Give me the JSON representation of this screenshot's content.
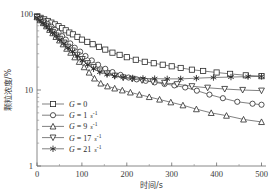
{
  "chart_data": {
    "type": "line",
    "title": "",
    "xlabel": "时间/s",
    "ylabel": "颗粒浓度/%",
    "xlim": [
      0,
      510
    ],
    "ylim": [
      1,
      100
    ],
    "yscale": "log",
    "grid": false,
    "legend_position": "lower-left-inside",
    "xticks": [
      "0",
      "100",
      "200",
      "300",
      "400",
      "500"
    ],
    "xtick_values": [
      0,
      100,
      200,
      300,
      400,
      500
    ],
    "yticks": [
      "1",
      "10",
      "100"
    ],
    "ytick_values": [
      1,
      10,
      100
    ],
    "series": [
      {
        "name": "G = 0",
        "legend_symbol": "G",
        "legend_value": "0",
        "legend_unit": "",
        "legend_exponent": "",
        "marker": "square",
        "x": [
          0,
          8,
          16,
          24,
          32,
          40,
          48,
          56,
          64,
          72,
          80,
          90,
          100,
          112,
          124,
          138,
          152,
          168,
          184,
          200,
          220,
          240,
          260,
          280,
          300,
          320,
          345,
          370,
          400,
          430,
          465,
          500
        ],
        "y": [
          93,
          89,
          85,
          81,
          77,
          73,
          69,
          65,
          61,
          57,
          54,
          50,
          46,
          43,
          40,
          37,
          34,
          31,
          29,
          27,
          25,
          23.5,
          22.5,
          21.5,
          20.5,
          19.5,
          18.5,
          17.8,
          17.0,
          16.3,
          15.6,
          15.2
        ]
      },
      {
        "name": "G = 1 s⁻¹",
        "legend_symbol": "G",
        "legend_value": "1",
        "legend_unit": "s",
        "legend_exponent": "-1",
        "marker": "circle",
        "x": [
          0,
          8,
          16,
          24,
          32,
          40,
          48,
          56,
          64,
          74,
          84,
          96,
          108,
          122,
          136,
          152,
          168,
          186,
          204,
          222,
          242,
          262,
          284,
          306,
          330,
          356,
          384,
          414,
          446,
          480,
          500
        ],
        "y": [
          92,
          86,
          80,
          74,
          68,
          62,
          57,
          51,
          46,
          41,
          36,
          32,
          28,
          24.5,
          21.5,
          19.0,
          17.2,
          15.8,
          14.6,
          13.8,
          13.2,
          12.6,
          12.0,
          11.5,
          10.8,
          9.8,
          8.7,
          7.8,
          7.0,
          6.6,
          6.4
        ]
      },
      {
        "name": "G = 9 s⁻¹",
        "legend_symbol": "G",
        "legend_value": "9",
        "legend_unit": "s",
        "legend_exponent": "-1",
        "marker": "triangle-up",
        "x": [
          0,
          7,
          14,
          21,
          28,
          35,
          42,
          50,
          58,
          66,
          75,
          84,
          94,
          105,
          116,
          128,
          142,
          157,
          173,
          190,
          208,
          228,
          250,
          273,
          298,
          325,
          355,
          388,
          422,
          460,
          500
        ],
        "y": [
          91,
          83,
          76,
          69,
          62,
          56,
          50,
          45,
          40,
          35,
          31,
          27,
          23.5,
          20.0,
          17.0,
          14.2,
          12.2,
          11.2,
          10.5,
          9.9,
          9.3,
          8.7,
          8.1,
          7.5,
          6.9,
          6.3,
          5.6,
          5.0,
          4.6,
          4.1,
          3.8
        ]
      },
      {
        "name": "G = 17 s⁻¹",
        "legend_symbol": "G",
        "legend_value": "17",
        "legend_unit": "s",
        "legend_exponent": "-1",
        "marker": "triangle-down",
        "x": [
          0,
          7,
          14,
          21,
          28,
          35,
          43,
          51,
          60,
          69,
          79,
          90,
          101,
          113,
          126,
          140,
          156,
          173,
          192,
          212,
          234,
          258,
          284,
          312,
          345,
          380,
          418,
          458,
          500
        ],
        "y": [
          91,
          84,
          77,
          70,
          64,
          58,
          52,
          47,
          42,
          37,
          33,
          29,
          25.5,
          22.5,
          20.0,
          18.0,
          16.5,
          15.4,
          14.6,
          14.0,
          13.4,
          12.9,
          12.4,
          11.9,
          11.2,
          10.7,
          10.3,
          10.0,
          9.8
        ]
      },
      {
        "name": "G = 21 s⁻¹",
        "legend_symbol": "G",
        "legend_value": "21",
        "legend_unit": "s",
        "legend_exponent": "-1",
        "marker": "star",
        "x": [
          0,
          7,
          14,
          21,
          28,
          35,
          43,
          51,
          60,
          69,
          79,
          90,
          101,
          113,
          126,
          140,
          156,
          173,
          192,
          213,
          236,
          262,
          290,
          320,
          355,
          393,
          432,
          470,
          500
        ],
        "y": [
          90,
          83,
          76,
          70,
          63,
          57,
          52,
          46,
          41,
          36,
          32,
          28,
          24.5,
          21.5,
          19.0,
          17.2,
          16.0,
          15.2,
          14.7,
          14.4,
          14.2,
          14.1,
          14.0,
          14.0,
          14.3,
          14.6,
          14.8,
          15.0,
          15.1
        ]
      }
    ]
  },
  "axes": {
    "x_title": "时间/s",
    "y_title": "颗粒浓度/%"
  },
  "legend": {
    "items": [
      {
        "marker": "square",
        "label": "G = 0",
        "sym": "G",
        "eq": " = ",
        "val": "0",
        "unit": "",
        "exp": ""
      },
      {
        "marker": "circle",
        "label": "G = 1 s⁻¹",
        "sym": "G",
        "eq": " = ",
        "val": "1",
        "unit": "s",
        "exp": "-1"
      },
      {
        "marker": "triangle-up",
        "label": "G = 9 s⁻¹",
        "sym": "G",
        "eq": " = ",
        "val": "9",
        "unit": "s",
        "exp": "-1"
      },
      {
        "marker": "triangle-down",
        "label": "G = 17 s⁻¹",
        "sym": "G",
        "eq": " = ",
        "val": "17",
        "unit": "s",
        "exp": "-1"
      },
      {
        "marker": "star",
        "label": "G = 21 s⁻¹",
        "sym": "G",
        "eq": " = ",
        "val": "21",
        "unit": "s",
        "exp": "-1"
      }
    ]
  },
  "colors": {
    "line": "#4a4a4a",
    "marker_stroke": "#2a2a2a",
    "marker_fill": "#ffffff",
    "axis": "#6b6b6b",
    "text": "#3a3a3a",
    "background": "#ffffff"
  }
}
